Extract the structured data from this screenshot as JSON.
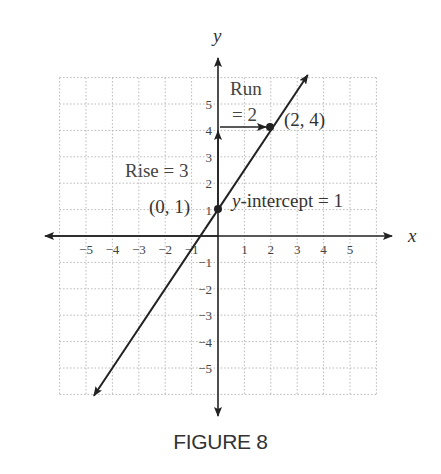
{
  "caption": "FIGURE 8",
  "chart_data": {
    "type": "line",
    "title": "FIGURE 8",
    "xlabel": "x",
    "ylabel": "y",
    "xlim": [
      -6,
      6
    ],
    "ylim": [
      -6,
      6
    ],
    "grid": true,
    "x_ticks": [
      -5,
      -4,
      -3,
      -2,
      -1,
      1,
      2,
      3,
      4,
      5
    ],
    "y_ticks": [
      -5,
      -4,
      -3,
      -2,
      -1,
      1,
      2,
      3,
      4,
      5
    ],
    "x_tick_labels": [
      "−5",
      "−4",
      "−3",
      "−2",
      "−1",
      "1",
      "2",
      "3",
      "4",
      "5"
    ],
    "y_tick_labels": [
      "−5",
      "−4",
      "−3",
      "−2",
      "−1",
      "1",
      "2",
      "3",
      "4",
      "5"
    ],
    "series": [
      {
        "name": "y = (3/2)x + 1",
        "slope": 1.5,
        "intercept": 1,
        "x": [
          -5.5,
          3.4
        ],
        "y": [
          -7.25,
          6.1
        ]
      }
    ],
    "points": [
      {
        "x": 0,
        "y": 1,
        "label": "(0, 1)"
      },
      {
        "x": 2,
        "y": 4,
        "label": "(2, 4)"
      }
    ],
    "annotations": [
      {
        "text": "Rise = 3",
        "type": "vertical-arrow",
        "from": [
          0,
          1
        ],
        "to": [
          0,
          4
        ]
      },
      {
        "text_line1": "Run",
        "text_line2": "= 2",
        "type": "horizontal-arrow",
        "from": [
          0,
          4
        ],
        "to": [
          2,
          4
        ]
      },
      {
        "text": "y-intercept = 1",
        "at": [
          0,
          1
        ]
      }
    ]
  },
  "labels": {
    "x_axis": "x",
    "y_axis": "y",
    "rise": "Rise = 3",
    "run_line1": "Run",
    "run_line2": "= 2",
    "point_a": "(0, 1)",
    "point_b": "(2, 4)",
    "intercept_italic": "y",
    "intercept_rest": "-intercept = 1"
  }
}
